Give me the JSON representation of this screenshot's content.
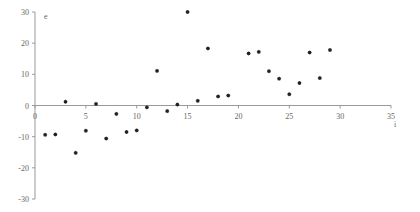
{
  "chart_data": {
    "type": "scatter",
    "title": "",
    "xlabel": "i",
    "ylabel": "e",
    "xlim": [
      0,
      35
    ],
    "ylim": [
      -30,
      30
    ],
    "x_ticks": [
      0,
      5,
      10,
      15,
      20,
      25,
      30,
      35
    ],
    "y_ticks": [
      -30,
      -20,
      -10,
      0,
      10,
      20,
      30
    ],
    "grid": false,
    "legend": null,
    "marker_color": "#222222",
    "axis_color": "#999999",
    "series": [
      {
        "name": "e",
        "points": [
          {
            "x": 1,
            "y": -9.4
          },
          {
            "x": 2,
            "y": -9.3
          },
          {
            "x": 3,
            "y": 1.2
          },
          {
            "x": 4,
            "y": -15.2
          },
          {
            "x": 5,
            "y": -8.1
          },
          {
            "x": 6,
            "y": 0.5
          },
          {
            "x": 7,
            "y": -10.6
          },
          {
            "x": 8,
            "y": -2.7
          },
          {
            "x": 9,
            "y": -8.5
          },
          {
            "x": 10,
            "y": -8.0
          },
          {
            "x": 11,
            "y": -0.6
          },
          {
            "x": 12,
            "y": 11.1
          },
          {
            "x": 13,
            "y": -1.8
          },
          {
            "x": 14,
            "y": 0.3
          },
          {
            "x": 15,
            "y": 30.0
          },
          {
            "x": 16,
            "y": 1.5
          },
          {
            "x": 17,
            "y": 18.3
          },
          {
            "x": 18,
            "y": 2.9
          },
          {
            "x": 19,
            "y": 3.2
          },
          {
            "x": 21,
            "y": 16.7
          },
          {
            "x": 22,
            "y": 17.2
          },
          {
            "x": 23,
            "y": 11.0
          },
          {
            "x": 24,
            "y": 8.6
          },
          {
            "x": 25,
            "y": 3.6
          },
          {
            "x": 26,
            "y": 7.2
          },
          {
            "x": 27,
            "y": 17.0
          },
          {
            "x": 28,
            "y": 8.8
          },
          {
            "x": 29,
            "y": 17.8
          }
        ]
      }
    ]
  }
}
